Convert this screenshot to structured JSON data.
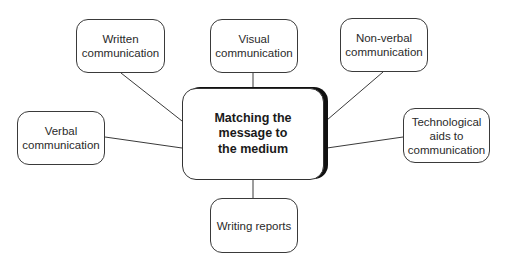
{
  "central_topic": {
    "lines": [
      "Matching the",
      "message to",
      "the medium"
    ]
  },
  "nodes": {
    "written": {
      "lines": [
        "Written",
        "communication"
      ]
    },
    "visual": {
      "lines": [
        "Visual",
        "communication"
      ]
    },
    "nonverbal": {
      "lines": [
        "Non-verbal",
        "communication"
      ]
    },
    "verbal": {
      "lines": [
        "Verbal",
        "communication"
      ]
    },
    "technological": {
      "lines": [
        "Technological",
        "aids to",
        "communication"
      ]
    },
    "reports": {
      "lines": [
        "Writing reports"
      ]
    }
  },
  "colors": {
    "line": "#3a3a3a",
    "border": "#3a3a3a",
    "shadow": "#111111",
    "background": "#ffffff"
  }
}
